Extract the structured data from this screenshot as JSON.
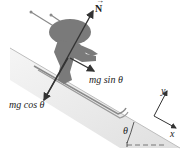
{
  "diagram": {
    "type": "free-body diagram",
    "forces": [
      {
        "id": "normal",
        "label": "N",
        "vector": true,
        "direction": "perpendicular to slope, upward"
      },
      {
        "id": "parallel",
        "label": "mg sin θ",
        "direction": "down the slope"
      },
      {
        "id": "perpendicular",
        "label": "mg cos θ",
        "direction": "into the slope"
      }
    ],
    "axes": {
      "x_label": "x",
      "y_label": "y"
    },
    "angle_label": "θ",
    "colors": {
      "slope_fill": "#e6e6e6",
      "skier": "#7a7a7a",
      "arrows": "#333333",
      "dashed_line": "#888888"
    }
  },
  "labels": {
    "N": "N",
    "mg_sin": "mg sin θ",
    "mg_cos": "mg cos θ",
    "x": "x",
    "y": "y",
    "theta": "θ"
  }
}
